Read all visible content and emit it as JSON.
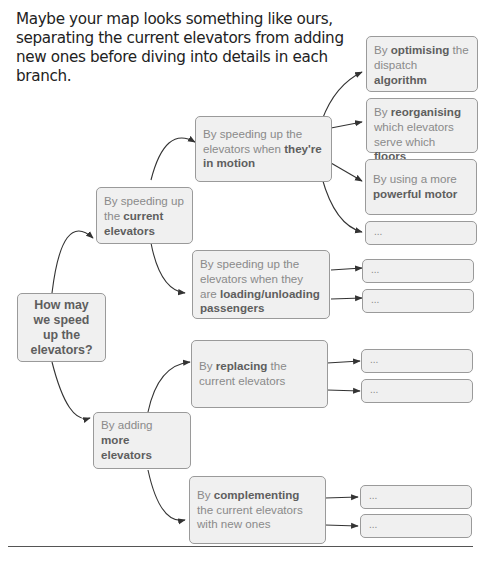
{
  "intro": {
    "text": "Maybe your map looks something like ours, separating the current elevators from adding new ones before diving into details in each branch."
  },
  "colors": {
    "node_fill": "#f0f0f0",
    "node_border": "#9a9a9a",
    "text_light": "#8a8a8a",
    "text_bold": "#5e5e5e",
    "arrow": "#333333"
  },
  "nodes": {
    "root": {
      "text": "How may we speed up the elevators?"
    },
    "current": {
      "pre": "By speeding up the ",
      "bold": "current elevators",
      "post": ""
    },
    "more": {
      "pre": "By adding ",
      "bold": "more elevators",
      "post": ""
    },
    "motion": {
      "pre": "By speeding up the elevators when ",
      "bold": "they're in motion",
      "post": ""
    },
    "loading": {
      "pre": "By speeding up the elevators when they are ",
      "bold": "loading/unloading passengers",
      "post": ""
    },
    "replacing": {
      "pre": "By ",
      "bold": "replacing",
      "post": " the current elevators"
    },
    "complementing": {
      "pre": "By ",
      "bold": "complementing",
      "post": " the current elevators with new ones"
    },
    "optimising": {
      "pre": "By ",
      "bold": "optimising",
      "mid": " the dispatch ",
      "bold2": "algorithm"
    },
    "reorganising": {
      "pre": "By ",
      "bold": "reorganising",
      "mid": " which elevators serve which ",
      "bold2": "floors"
    },
    "motor": {
      "pre": "By using a more ",
      "bold": "powerful motor"
    },
    "placeholder": "..."
  }
}
